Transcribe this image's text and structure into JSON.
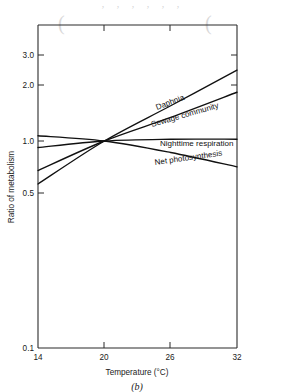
{
  "page": {
    "bleed_through_top": ", ,      ,      ,      ,      ,",
    "bleed_mark_left": "(",
    "bleed_mark_right": "("
  },
  "figure": {
    "caption": "(b)"
  },
  "chart_data": {
    "type": "line",
    "title": "",
    "xlabel": "Temperature (°C)",
    "ylabel": "Ratio of metabolism",
    "xlim": [
      14,
      32
    ],
    "ylim": [
      0.1,
      3.5
    ],
    "yscale": "log",
    "xscale": "linear",
    "grid": false,
    "legend": "inline-labels",
    "xticks": [
      14,
      20,
      26,
      32
    ],
    "xtick_labels": [
      "14",
      "20",
      "26",
      "32"
    ],
    "yticks": [
      0.1,
      0.5,
      1.0,
      2.0,
      3.0
    ],
    "ytick_labels": [
      "0.1",
      "0.5",
      "1.0",
      "2.0",
      "3.0"
    ],
    "crossover_point": {
      "x": 20,
      "y": 1.0
    },
    "series": [
      {
        "name": "Daphnia",
        "label": "Daphnia",
        "x": [
          14,
          20,
          26,
          32
        ],
        "y": [
          0.62,
          1.0,
          1.48,
          2.2
        ]
      },
      {
        "name": "Sewage community",
        "label": "Sewage community",
        "x": [
          14,
          20,
          26,
          32
        ],
        "y": [
          0.72,
          1.0,
          1.3,
          1.72
        ]
      },
      {
        "name": "Nighttime respiration",
        "label": "Nighttime respiration",
        "x": [
          14,
          20,
          26,
          32
        ],
        "y": [
          0.93,
          1.0,
          1.02,
          1.02
        ]
      },
      {
        "name": "Net photosynthesis",
        "label": "Net photosynthesis",
        "x": [
          14,
          20,
          26,
          32
        ],
        "y": [
          1.06,
          1.0,
          0.88,
          0.75
        ]
      }
    ]
  },
  "colors": {
    "axis": "#2b2b2b",
    "curve": "#111111",
    "text": "#1a1a1a",
    "background": "#ffffff"
  }
}
